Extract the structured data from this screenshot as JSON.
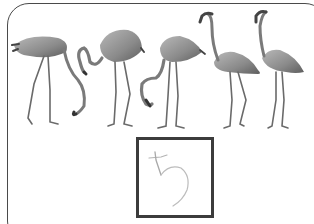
{
  "worksheet": {
    "task": "count-the-flamingos",
    "illustration": {
      "subject": "flamingo",
      "count": 5,
      "items": [
        {
          "pose": "head-down-grazing",
          "facing": "left"
        },
        {
          "pose": "neck-curved-down",
          "facing": "right"
        },
        {
          "pose": "head-down-feeding",
          "facing": "right"
        },
        {
          "pose": "standing-upright",
          "facing": "left"
        },
        {
          "pose": "standing-upright",
          "facing": "left"
        }
      ]
    },
    "answer": {
      "value": "5",
      "style": "handwritten-pencil"
    }
  },
  "colors": {
    "frame": "#4a4a4a",
    "answer_box_border": "#3c3c3c",
    "handwriting": "#b4b4b4",
    "bird_body": "#8a8a8a",
    "bird_dark": "#4e4e4e"
  }
}
